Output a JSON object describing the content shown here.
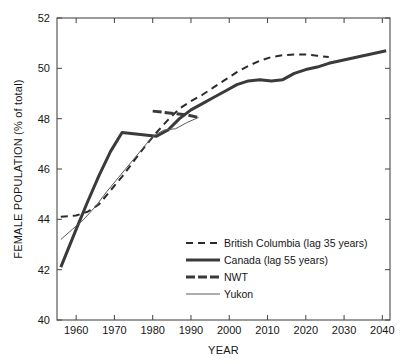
{
  "chart_data": {
    "type": "line",
    "title": "",
    "xlabel": "YEAR",
    "ylabel": "FEMALE POPULATION (% of total)",
    "xlim": [
      1955,
      2042
    ],
    "ylim": [
      40,
      52
    ],
    "xticks": [
      1960,
      1970,
      1980,
      1990,
      2000,
      2010,
      2020,
      2030,
      2040
    ],
    "yticks": [
      40,
      42,
      44,
      46,
      48,
      50,
      52
    ],
    "grid": false,
    "legend_position": "lower right",
    "series": [
      {
        "name": "British Columbia (lag 35 years)",
        "style": "dashed",
        "color": "#2b2b2b",
        "width": 2.0,
        "x": [
          1956,
          1960,
          1963,
          1966,
          1969,
          1972,
          1975,
          1978,
          1981,
          1984,
          1987,
          1990,
          1993,
          1996,
          1999,
          2002,
          2005,
          2008,
          2011,
          2014,
          2017,
          2020,
          2023,
          2026
        ],
        "y": [
          44.1,
          44.15,
          44.3,
          44.6,
          45.15,
          45.7,
          46.3,
          46.9,
          47.45,
          47.95,
          48.4,
          48.7,
          48.95,
          49.25,
          49.55,
          49.85,
          50.1,
          50.3,
          50.45,
          50.52,
          50.55,
          50.55,
          50.5,
          50.45
        ]
      },
      {
        "name": "Canada (lag 55 years)",
        "style": "thick-solid",
        "color": "#3a3a3a",
        "width": 3.0,
        "x": [
          1956,
          1960,
          1963,
          1966,
          1969,
          1972,
          1975,
          1978,
          1981,
          1984,
          1987,
          1990,
          1993,
          1996,
          1999,
          2002,
          2005,
          2008,
          2011,
          2014,
          2017,
          2020,
          2023,
          2026,
          2029,
          2032,
          2035,
          2038,
          2041
        ],
        "y": [
          42.1,
          43.6,
          44.7,
          45.75,
          46.7,
          47.45,
          47.4,
          47.35,
          47.3,
          47.55,
          48.0,
          48.35,
          48.6,
          48.85,
          49.1,
          49.35,
          49.5,
          49.55,
          49.5,
          49.55,
          49.8,
          49.95,
          50.05,
          50.2,
          50.3,
          50.4,
          50.5,
          50.6,
          50.7
        ]
      },
      {
        "name": "NWT",
        "style": "thick-short",
        "color": "#3a3a3a",
        "width": 3.0,
        "x": [
          1980,
          1983,
          1986,
          1989,
          1992
        ],
        "y": [
          48.3,
          48.25,
          48.2,
          48.15,
          48.05
        ]
      },
      {
        "name": "Yukon",
        "style": "thin-solid",
        "color": "#5a5a5a",
        "width": 1.0,
        "x": [
          1956,
          1959,
          1962,
          1965,
          1968,
          1971,
          1974,
          1977,
          1980,
          1983,
          1986,
          1989,
          1992
        ],
        "y": [
          43.2,
          43.6,
          44.0,
          44.5,
          45.1,
          45.65,
          46.2,
          46.75,
          47.3,
          47.55,
          47.6,
          47.85,
          48.05
        ]
      }
    ]
  },
  "legend": {
    "items": [
      {
        "label": "British Columbia (lag 35 years)",
        "swatch": "dashed"
      },
      {
        "label": "Canada (lag 55 years)",
        "swatch": "thick-solid"
      },
      {
        "label": "NWT",
        "swatch": "thick-short"
      },
      {
        "label": "Yukon",
        "swatch": "thin-solid"
      }
    ]
  }
}
